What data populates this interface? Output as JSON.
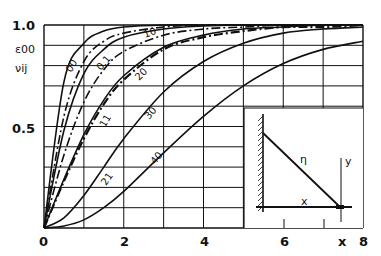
{
  "chart_data": {
    "type": "line",
    "title": "",
    "xlabel": "x",
    "ylabel": [
      "ε00",
      "νij"
    ],
    "xlim": [
      0,
      8
    ],
    "ylim": [
      0,
      1.0
    ],
    "x_ticks": [
      "0",
      "2",
      "4",
      "6",
      "8"
    ],
    "y_ticks": [
      "0.5",
      "1.0"
    ],
    "grid": true,
    "grid_x_step": 1,
    "grid_y_step": 0.1,
    "x": [
      0,
      0.5,
      1,
      1.5,
      2,
      3,
      4,
      5,
      6,
      7,
      8
    ],
    "series": [
      {
        "name": "00",
        "style": "solid",
        "values": [
          0,
          0.72,
          0.91,
          0.97,
          0.99,
          1.0,
          1.0,
          1.0,
          1.0,
          1.0,
          1.0
        ]
      },
      {
        "name": "01",
        "style": "dashdot",
        "values": [
          0,
          0.55,
          0.82,
          0.92,
          0.96,
          0.99,
          1.0,
          1.0,
          1.0,
          1.0,
          1.0
        ]
      },
      {
        "name": "10",
        "style": "solid",
        "values": [
          0,
          0.48,
          0.76,
          0.88,
          0.94,
          0.98,
          0.995,
          1.0,
          1.0,
          1.0,
          1.0
        ]
      },
      {
        "name": "11",
        "style": "dashdot",
        "values": [
          0,
          0.36,
          0.62,
          0.78,
          0.87,
          0.95,
          0.98,
          0.99,
          1.0,
          1.0,
          1.0
        ]
      },
      {
        "name": "20",
        "style": "solid",
        "values": [
          0,
          0.24,
          0.46,
          0.63,
          0.75,
          0.89,
          0.95,
          0.98,
          0.99,
          1.0,
          1.0
        ]
      },
      {
        "name": "21",
        "style": "dashdot",
        "values": [
          0,
          0.23,
          0.44,
          0.61,
          0.73,
          0.88,
          0.94,
          0.97,
          0.99,
          0.99,
          1.0
        ]
      },
      {
        "name": "30",
        "style": "solid",
        "values": [
          0,
          0.05,
          0.16,
          0.3,
          0.44,
          0.67,
          0.82,
          0.91,
          0.96,
          0.98,
          0.99
        ]
      },
      {
        "name": "40",
        "style": "solid",
        "values": [
          0,
          0.01,
          0.04,
          0.1,
          0.18,
          0.37,
          0.55,
          0.7,
          0.81,
          0.88,
          0.92
        ]
      }
    ],
    "annotations": [
      "00",
      "0.1",
      "10",
      "20",
      "11",
      "30",
      "21",
      "40"
    ],
    "inset": {
      "labels": {
        "eta": "η",
        "x": "x",
        "y": "y"
      }
    }
  }
}
